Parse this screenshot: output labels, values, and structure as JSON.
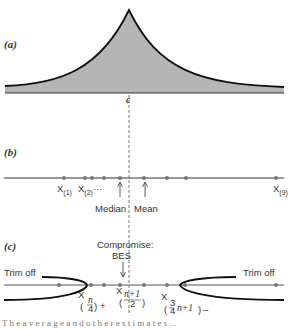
{
  "figure": {
    "panel_a": {
      "label": "(a)",
      "center_label": "c",
      "description": "Symmetric heavy-tailed (cusp-shaped) density, shaded gray, centered at c"
    },
    "panel_b": {
      "label": "(b)",
      "points_x": [
        64,
        85,
        92,
        104,
        120,
        144,
        167,
        186,
        276
      ],
      "labels": {
        "x1": "X",
        "x1_sub": "(1)",
        "x2": "X",
        "x2_sub": "(2)",
        "x2_suffix": "···",
        "x9": "X",
        "x9_sub": "(9)",
        "median": "Median",
        "mean": "Mean"
      }
    },
    "panel_c": {
      "label": "(c)",
      "points_x": [
        59,
        91,
        104,
        120,
        144,
        167,
        185,
        276
      ],
      "compromise_label": "Compromise:",
      "bes_label": "BES",
      "trim_left": "Trim off",
      "trim_right": "Trim off",
      "lower_quartile": {
        "var": "X",
        "num": "n",
        "den": "4",
        "suffix": "+"
      },
      "middle": {
        "var": "X",
        "num": "n+1",
        "den": "2"
      },
      "upper_quartile": {
        "var": "X",
        "frac_num": "3",
        "frac_den": "4",
        "rest": "n+1",
        "suffix": "–"
      }
    },
    "caption_fragment": "T h e  a v e r a g e  a n d  o t h e r  e s t i m a t e s ..."
  }
}
